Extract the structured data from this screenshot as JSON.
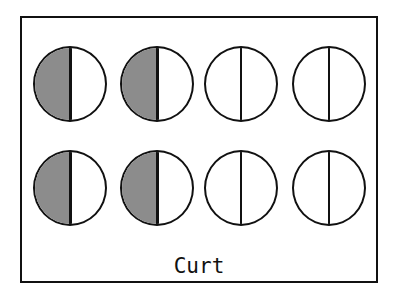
{
  "label": "Curt",
  "colors": {
    "shade": "#8c8c8c",
    "outline": "#111111",
    "background": "#ffffff"
  },
  "grid": {
    "rows": [
      [
        {
          "state": "half-shaded"
        },
        {
          "state": "half-shaded"
        },
        {
          "state": "empty"
        },
        {
          "state": "empty"
        }
      ],
      [
        {
          "state": "half-shaded"
        },
        {
          "state": "half-shaded"
        },
        {
          "state": "empty"
        },
        {
          "state": "empty"
        }
      ]
    ]
  }
}
